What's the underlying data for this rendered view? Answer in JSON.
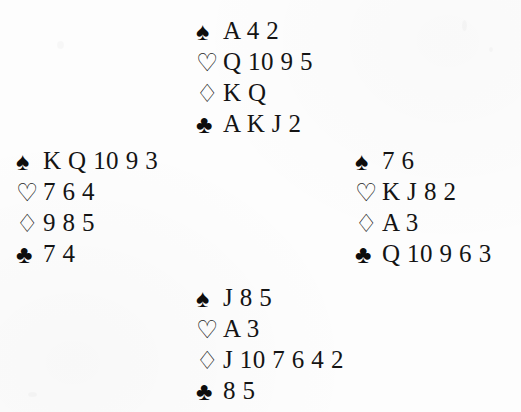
{
  "document": {
    "kind": "bridge-deal-diagram",
    "background_color": "#fdfdfd",
    "ink_color": "#141414"
  },
  "suits": {
    "spades": {
      "name": "spade-suit-symbol",
      "glyph": "♠",
      "fill": "solid"
    },
    "hearts": {
      "name": "heart-suit-symbol",
      "glyph": "♡",
      "fill": "hollow"
    },
    "diamonds": {
      "name": "diamond-suit-symbol",
      "glyph": "♢",
      "fill": "hollow"
    },
    "clubs": {
      "name": "club-suit-symbol",
      "glyph": "♣",
      "fill": "solid"
    }
  },
  "hands": {
    "north": {
      "position": "North",
      "spades": "A 4 2",
      "hearts": "Q 10 9 5",
      "diamonds": "K Q",
      "clubs": "A K J 2"
    },
    "west": {
      "position": "West",
      "spades": "K Q 10 9 3",
      "hearts": "7 6 4",
      "diamonds": "9 8 5",
      "clubs": "7 4"
    },
    "east": {
      "position": "East",
      "spades": "7 6",
      "hearts": "K J 8 2",
      "diamonds": "A 3",
      "clubs": "Q 10 9 6 3"
    },
    "south": {
      "position": "South",
      "spades": "J 8 5",
      "hearts": "A 3",
      "diamonds": "J 10 7 6 4 2",
      "clubs": "8 5"
    }
  }
}
